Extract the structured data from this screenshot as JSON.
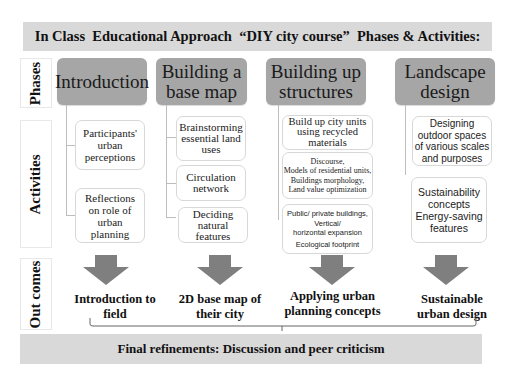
{
  "header": {
    "title": "In Class  Educational Approach  “DIY city course”  Phases & Activities:"
  },
  "row_labels": {
    "phases": "Phases",
    "activities": "Activities",
    "outcomes": "Out comes"
  },
  "columns": [
    {
      "phase": "Introduction",
      "activities": [
        "Participants' urban perceptions",
        "Reflections on role of urban planning"
      ],
      "outcome": [
        "Introduction to",
        "field"
      ]
    },
    {
      "phase": [
        "Building a",
        "base map"
      ],
      "activities": [
        "Brainstorming essential land uses",
        "Circulation network",
        "Deciding natural features"
      ],
      "outcome": [
        "2D base map of",
        "their city"
      ]
    },
    {
      "phase": [
        "Building up",
        "structures"
      ],
      "activities": [
        [
          "Build up city units",
          "using recycled",
          "materials"
        ],
        [
          "Discourse,",
          "Models of residential units,",
          "Buildings morphology,",
          "Land value optimization"
        ],
        [
          "Public/ private buildings,",
          "Vertical/",
          "horizontal expansion",
          "Ecological footprint"
        ]
      ],
      "outcome": [
        "Applying urban",
        "planning concepts"
      ]
    },
    {
      "phase": [
        "Landscape",
        "design"
      ],
      "activities": [
        [
          "Designing",
          "outdoor spaces",
          "of various scales",
          "and purposes"
        ],
        [
          "Sustainability",
          "concepts",
          "Energy-saving",
          "features"
        ]
      ],
      "outcome": [
        "Sustainable",
        "urban design"
      ]
    }
  ],
  "footer": {
    "title": "Final refinements: Discussion and peer criticism"
  },
  "colors": {
    "banner": "#d9d9d9",
    "phase_box": "#a6a6a6",
    "arrow": "#7f7f7f",
    "line": "#bdbdbd"
  }
}
